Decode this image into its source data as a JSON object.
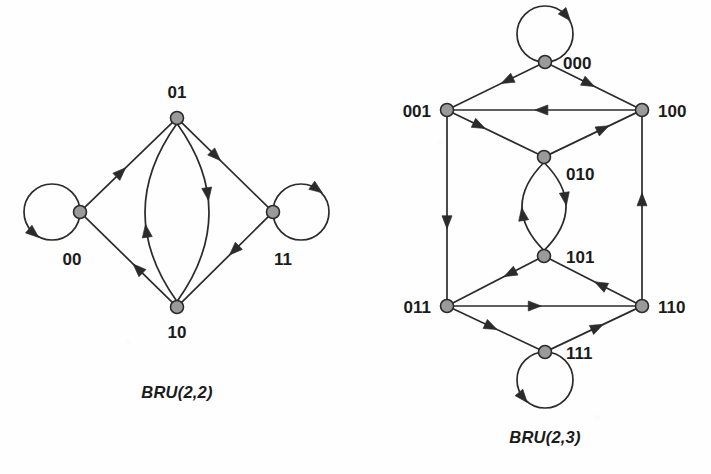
{
  "page": {
    "background": "#fefefe",
    "width": 711,
    "height": 474
  },
  "style": {
    "node_fill": "#9a9a9a",
    "node_stroke": "#2b2b2b",
    "edge_color": "#2b2b2b",
    "label_color": "#1b1b1b",
    "node_radius": 6.5,
    "edge_width": 1.7
  },
  "diagram_data": {
    "type": "diagram",
    "kind": "directed-graph",
    "figures": [
      {
        "id": "bru22",
        "caption": "BRU(2,2)",
        "caption_pos": {
          "x": 177,
          "y": 398
        },
        "nodes": [
          {
            "id": "01",
            "label": "01",
            "x": 177,
            "y": 118,
            "label_pos": {
              "x": 177,
              "y": 98
            },
            "label_anchor": "middle"
          },
          {
            "id": "00",
            "label": "00",
            "x": 80,
            "y": 212,
            "label_pos": {
              "x": 72,
              "y": 265
            },
            "label_anchor": "middle"
          },
          {
            "id": "11",
            "label": "11",
            "x": 273,
            "y": 212,
            "label_pos": {
              "x": 283,
              "y": 265
            },
            "label_anchor": "middle"
          },
          {
            "id": "10",
            "label": "10",
            "x": 177,
            "y": 307,
            "label_pos": {
              "x": 177,
              "y": 338
            },
            "label_anchor": "middle"
          }
        ],
        "edges": [
          {
            "from": "00",
            "to": "00",
            "kind": "self-loop",
            "loop_dir": "left",
            "arrow_at": 0.6
          },
          {
            "from": "11",
            "to": "11",
            "kind": "self-loop",
            "loop_dir": "right",
            "arrow_at": 0.62
          },
          {
            "from": "00",
            "to": "01",
            "kind": "line",
            "arrow_at": 0.42
          },
          {
            "from": "01",
            "to": "11",
            "kind": "line",
            "arrow_at": 0.4
          },
          {
            "from": "11",
            "to": "10",
            "kind": "line",
            "arrow_at": 0.4
          },
          {
            "from": "10",
            "to": "00",
            "kind": "line",
            "arrow_at": 0.4
          },
          {
            "from": "01",
            "to": "10",
            "kind": "curve",
            "bow": -32,
            "arrow_at": 0.4
          },
          {
            "from": "10",
            "to": "01",
            "kind": "curve",
            "bow": -32,
            "arrow_at": 0.4
          }
        ]
      },
      {
        "id": "bru23",
        "caption": "BRU(2,3)",
        "caption_pos": {
          "x": 545,
          "y": 443
        },
        "nodes": [
          {
            "id": "000",
            "label": "000",
            "x": 545,
            "y": 62,
            "label_pos": {
              "x": 563,
              "y": 69
            },
            "label_anchor": "start"
          },
          {
            "id": "001",
            "label": "001",
            "x": 447,
            "y": 110,
            "label_pos": {
              "x": 431,
              "y": 117
            },
            "label_anchor": "end"
          },
          {
            "id": "100",
            "label": "100",
            "x": 642,
            "y": 110,
            "label_pos": {
              "x": 658,
              "y": 117
            },
            "label_anchor": "start"
          },
          {
            "id": "010",
            "label": "010",
            "x": 544,
            "y": 157,
            "label_pos": {
              "x": 566,
              "y": 180
            },
            "label_anchor": "start"
          },
          {
            "id": "101",
            "label": "101",
            "x": 544,
            "y": 256,
            "label_pos": {
              "x": 566,
              "y": 263
            },
            "label_anchor": "start"
          },
          {
            "id": "011",
            "label": "011",
            "x": 447,
            "y": 306,
            "label_pos": {
              "x": 431,
              "y": 313
            },
            "label_anchor": "end"
          },
          {
            "id": "110",
            "label": "110",
            "x": 642,
            "y": 306,
            "label_pos": {
              "x": 658,
              "y": 313
            },
            "label_anchor": "start"
          },
          {
            "id": "111",
            "label": "111",
            "x": 545,
            "y": 352,
            "label_pos": {
              "x": 566,
              "y": 359
            },
            "label_anchor": "start"
          }
        ],
        "edges": [
          {
            "from": "000",
            "to": "000",
            "kind": "self-loop",
            "loop_dir": "up",
            "arrow_at": 0.62
          },
          {
            "from": "111",
            "to": "111",
            "kind": "self-loop",
            "loop_dir": "down",
            "arrow_at": 0.62
          },
          {
            "from": "000",
            "to": "001",
            "kind": "line",
            "arrow_at": 0.38
          },
          {
            "from": "000",
            "to": "100",
            "kind": "line",
            "arrow_at": 0.45
          },
          {
            "from": "100",
            "to": "001",
            "kind": "line",
            "arrow_at": 0.52
          },
          {
            "from": "001",
            "to": "010",
            "kind": "line",
            "arrow_at": 0.32
          },
          {
            "from": "010",
            "to": "100",
            "kind": "line",
            "arrow_at": 0.62
          },
          {
            "from": "001",
            "to": "011",
            "kind": "line",
            "arrow_at": 0.58
          },
          {
            "from": "110",
            "to": "100",
            "kind": "line",
            "arrow_at": 0.55
          },
          {
            "from": "010",
            "to": "101",
            "kind": "curve",
            "bow": -22,
            "arrow_at": 0.42
          },
          {
            "from": "101",
            "to": "010",
            "kind": "curve",
            "bow": -22,
            "arrow_at": 0.42
          },
          {
            "from": "101",
            "to": "011",
            "kind": "line",
            "arrow_at": 0.34
          },
          {
            "from": "110",
            "to": "101",
            "kind": "line",
            "arrow_at": 0.42
          },
          {
            "from": "011",
            "to": "110",
            "kind": "line",
            "arrow_at": 0.45
          },
          {
            "from": "011",
            "to": "111",
            "kind": "line",
            "arrow_at": 0.45
          },
          {
            "from": "111",
            "to": "110",
            "kind": "line",
            "arrow_at": 0.55
          }
        ]
      }
    ]
  }
}
